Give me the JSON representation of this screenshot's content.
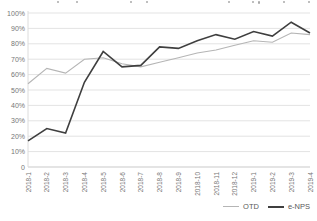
{
  "chart_data": {
    "type": "line",
    "categories": [
      "2018-1",
      "2018-2",
      "2018-3",
      "2018-4",
      "2018-5",
      "2018-6",
      "2018-7",
      "2018-8",
      "2018-9",
      "2018-10",
      "2018-11",
      "2018-12",
      "2019-1",
      "2019-2",
      "2019-3",
      "2019-4"
    ],
    "series": [
      {
        "name": "OTD",
        "color": "#b5b5b5",
        "width": 1.1,
        "values": [
          54,
          64,
          61,
          70,
          71,
          67,
          65,
          68,
          71,
          74,
          76,
          79,
          82,
          81,
          87,
          86
        ]
      },
      {
        "name": "e-NPS",
        "color": "#3f3f3f",
        "width": 1.6,
        "values": [
          17,
          25,
          22,
          55,
          75,
          65,
          66,
          78,
          77,
          82,
          86,
          83,
          88,
          85,
          94,
          87
        ]
      }
    ],
    "title": "",
    "xlabel": "",
    "ylabel": "",
    "ylim": [
      0,
      100
    ],
    "ytick_step": 10,
    "ytick_labels": [
      "100%",
      "90%",
      "80%",
      "70%",
      "60%",
      "50%",
      "40%",
      "30%",
      "20%",
      "10%",
      "0"
    ],
    "grid": "horizontal",
    "legend_position": "bottom-right",
    "colors": {
      "gridline": "#e3e3e3",
      "axis_line": "#c9c9c9",
      "tick_text": "#767676",
      "legend_text": "#595959"
    }
  },
  "legend": {
    "items": [
      {
        "label": "OTD"
      },
      {
        "label": "e-NPS"
      }
    ]
  }
}
